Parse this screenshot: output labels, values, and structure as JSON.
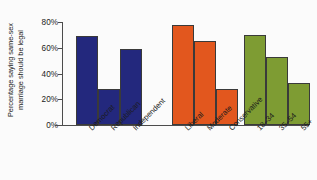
{
  "chart_data": {
    "type": "bar",
    "title": "",
    "subtitle": "",
    "xlabel": "",
    "ylabel": "Percentage saying same-sex marriage should be legal",
    "ylabel_lines": [
      "Percentage saying same-sex",
      "marriage should be legal"
    ],
    "ylim": [
      0,
      80
    ],
    "ytick_values": [
      0,
      20,
      40,
      60,
      80
    ],
    "ytick_labels": [
      "0%",
      "20%",
      "40%",
      "60%",
      "80%"
    ],
    "grid": false,
    "legend": "none",
    "categories": [
      "Democrat",
      "Republican",
      "Independent",
      "Liberal",
      "Moderate",
      "Conservative",
      "18–34",
      "35–54",
      "55+"
    ],
    "values": [
      69,
      28,
      59,
      78,
      65,
      28,
      70,
      53,
      33
    ],
    "groups": [
      {
        "name": "Party identification",
        "color": "#23287d",
        "categories": [
          "Democrat",
          "Republican",
          "Independent"
        ],
        "values": [
          69,
          28,
          59
        ]
      },
      {
        "name": "Political ideology",
        "color": "#e2571e",
        "categories": [
          "Liberal",
          "Moderate",
          "Conservative"
        ],
        "values": [
          78,
          65,
          28
        ]
      },
      {
        "name": "Age group",
        "color": "#7e9c33",
        "categories": [
          "18–34",
          "35–54",
          "55+"
        ],
        "values": [
          70,
          53,
          33
        ]
      }
    ],
    "colors": {
      "party": "#23287d",
      "ideology": "#e2571e",
      "age": "#7e9c33",
      "axis": "#4c4c4c",
      "bar_outline": "#3a3a3a",
      "text": "#1b1b1b",
      "background": "#fbfbfb"
    }
  }
}
